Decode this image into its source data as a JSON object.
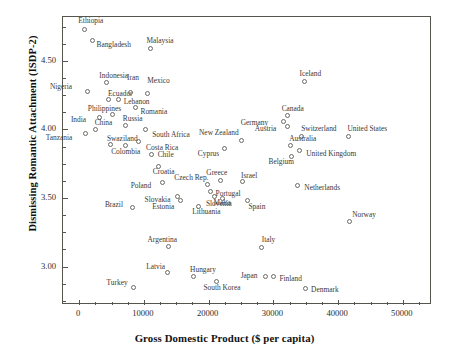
{
  "chart_data": {
    "type": "scatter",
    "title": "",
    "xlabel": "Gross Domestic Product ($ per capita)",
    "ylabel": "Dismissing Romantic Attachment (ISDP-2)",
    "xlim": [
      -2500,
      54500
    ],
    "ylim": [
      2.72,
      4.82
    ],
    "grid": false,
    "legend": "none",
    "xticks": [
      0,
      10000,
      20000,
      30000,
      40000,
      50000
    ],
    "xtick_labels": [
      "0",
      "10000",
      "20000",
      "30000",
      "40000",
      "50000"
    ],
    "yticks": [
      3.0,
      3.5,
      4.0,
      4.5
    ],
    "ytick_labels": [
      "3.00",
      "3.50",
      "4.00",
      "4.50"
    ],
    "marker": "open-circle",
    "point_label_position": "varies",
    "points": [
      {
        "label": "Ethiopia",
        "x": 800,
        "y": 4.73,
        "lx": -6,
        "ly": -12
      },
      {
        "label": "Bangladesh",
        "x": 2050,
        "y": 4.65,
        "lx": 4,
        "ly": 1
      },
      {
        "label": "Malaysia",
        "x": 11000,
        "y": 4.59,
        "lx": -4,
        "ly": -12
      },
      {
        "label": "Indonesia",
        "x": 4200,
        "y": 4.34,
        "lx": -7,
        "ly": -11
      },
      {
        "label": "Nigeria",
        "x": 1350,
        "y": 4.28,
        "lx": -38,
        "ly": -8
      },
      {
        "label": "Ecuador",
        "x": 4600,
        "y": 4.22,
        "lx": -1,
        "ly": -9
      },
      {
        "label": "Iran",
        "x": 8000,
        "y": 4.27,
        "lx": -4,
        "ly": -18
      },
      {
        "label": "Mexico",
        "x": 10500,
        "y": 4.26,
        "lx": 0,
        "ly": -17
      },
      {
        "label": "Lebanon",
        "x": 6100,
        "y": 4.22,
        "lx": 5,
        "ly": -1
      },
      {
        "label": "Philippines",
        "x": 5200,
        "y": 4.11,
        "lx": -25,
        "ly": -9
      },
      {
        "label": "Romania",
        "x": 8700,
        "y": 4.16,
        "lx": 5,
        "ly": 0
      },
      {
        "label": "India",
        "x": 3200,
        "y": 4.09,
        "lx": -29,
        "ly": -1
      },
      {
        "label": "Russia",
        "x": 7200,
        "y": 4.03,
        "lx": -3,
        "ly": -10
      },
      {
        "label": "China",
        "x": 2550,
        "y": 4.0,
        "lx": -1,
        "ly": -10
      },
      {
        "label": "South Africa",
        "x": 10200,
        "y": 4.0,
        "lx": 7,
        "ly": 2
      },
      {
        "label": "Tanzania",
        "x": 1000,
        "y": 3.97,
        "lx": -40,
        "ly": 0
      },
      {
        "label": "Swaziland",
        "x": 4900,
        "y": 3.89,
        "lx": -4,
        "ly": -10
      },
      {
        "label": "Costa Rica",
        "x": 9100,
        "y": 3.91,
        "lx": 8,
        "ly": 2
      },
      {
        "label": "Colombia",
        "x": 7100,
        "y": 3.88,
        "lx": -14,
        "ly": 2
      },
      {
        "label": "Chile",
        "x": 11200,
        "y": 3.82,
        "lx": 6,
        "ly": -3
      },
      {
        "label": "Croatia",
        "x": 12300,
        "y": 3.73,
        "lx": -6,
        "ly": 2
      },
      {
        "label": "Poland",
        "x": 12900,
        "y": 3.61,
        "lx": -32,
        "ly": -1
      },
      {
        "label": "Czech Rep.",
        "x": 19800,
        "y": 3.6,
        "lx": -33,
        "ly": -10
      },
      {
        "label": "New Zealand",
        "x": 25000,
        "y": 3.92,
        "lx": -42,
        "ly": -11
      },
      {
        "label": "Austria",
        "x": 32200,
        "y": 4.02,
        "lx": -33,
        "ly": -2
      },
      {
        "label": "Germany",
        "x": 31600,
        "y": 4.06,
        "lx": -43,
        "ly": -2
      },
      {
        "label": "Canada",
        "x": 32200,
        "y": 4.1,
        "lx": -6,
        "ly": -11
      },
      {
        "label": "Iceland",
        "x": 34800,
        "y": 4.35,
        "lx": -5,
        "ly": -11
      },
      {
        "label": "Switzerland",
        "x": 34300,
        "y": 3.95,
        "lx": 0,
        "ly": -11
      },
      {
        "label": "United States",
        "x": 41600,
        "y": 3.95,
        "lx": -1,
        "ly": -11
      },
      {
        "label": "Australia",
        "x": 32600,
        "y": 3.88,
        "lx": -1,
        "ly": -11
      },
      {
        "label": "Cyprus",
        "x": 22500,
        "y": 3.86,
        "lx": -27,
        "ly": 1
      },
      {
        "label": "United Kingdom",
        "x": 34000,
        "y": 3.85,
        "lx": 7,
        "ly": 0
      },
      {
        "label": "Belgium",
        "x": 32800,
        "y": 3.8,
        "lx": -23,
        "ly": 1
      },
      {
        "label": "Greece",
        "x": 21800,
        "y": 3.63,
        "lx": -14,
        "ly": -11
      },
      {
        "label": "Israel",
        "x": 25300,
        "y": 3.62,
        "lx": -2,
        "ly": -10
      },
      {
        "label": "Netherlands",
        "x": 33700,
        "y": 3.59,
        "lx": 7,
        "ly": -2
      },
      {
        "label": "Portugal",
        "x": 20300,
        "y": 3.55,
        "lx": 5,
        "ly": -1
      },
      {
        "label": "Malta",
        "x": 20900,
        "y": 3.51,
        "lx": -1,
        "ly": 2
      },
      {
        "label": "Slovakia",
        "x": 15200,
        "y": 3.51,
        "lx": -33,
        "ly": -1
      },
      {
        "label": "Slovenia",
        "x": 22200,
        "y": 3.5,
        "lx": -17,
        "ly": 2
      },
      {
        "label": "Spain",
        "x": 26000,
        "y": 3.48,
        "lx": 1,
        "ly": 2
      },
      {
        "label": "Estonia",
        "x": 15600,
        "y": 3.48,
        "lx": -28,
        "ly": 2
      },
      {
        "label": "Brazil",
        "x": 8300,
        "y": 3.43,
        "lx": -28,
        "ly": -7
      },
      {
        "label": "Lithuania",
        "x": 18400,
        "y": 3.44,
        "lx": -6,
        "ly": 2
      },
      {
        "label": "Norway",
        "x": 41700,
        "y": 3.33,
        "lx": 3,
        "ly": -10
      },
      {
        "label": "Argentina",
        "x": 13800,
        "y": 3.15,
        "lx": -21,
        "ly": -10
      },
      {
        "label": "Italy",
        "x": 28200,
        "y": 3.14,
        "lx": 0,
        "ly": -11
      },
      {
        "label": "Latvia",
        "x": 13600,
        "y": 2.96,
        "lx": -21,
        "ly": -9
      },
      {
        "label": "Hungary",
        "x": 17600,
        "y": 2.93,
        "lx": -3,
        "ly": -10
      },
      {
        "label": "Turkey",
        "x": 8400,
        "y": 2.85,
        "lx": -27,
        "ly": -8
      },
      {
        "label": "South Korea",
        "x": 21200,
        "y": 2.89,
        "lx": -13,
        "ly": 2
      },
      {
        "label": "Japan",
        "x": 28800,
        "y": 2.93,
        "lx": -25,
        "ly": -4
      },
      {
        "label": "Finland",
        "x": 30000,
        "y": 2.93,
        "lx": 6,
        "ly": -1
      },
      {
        "label": "Denmark",
        "x": 34900,
        "y": 2.84,
        "lx": 6,
        "ly": -3
      }
    ],
    "axis_color": "#55544f",
    "marker_color": "#6b6a64",
    "text_color": "#2e2d2a"
  }
}
